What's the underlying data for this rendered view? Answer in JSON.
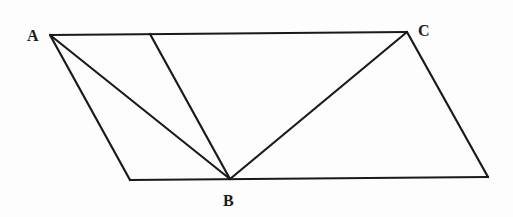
{
  "diagram": {
    "type": "geometry-parallelogram",
    "stroke_color": "#1a1a1a",
    "background": "#fdfdfd",
    "points": {
      "A": {
        "label": "A",
        "x": 50,
        "y": 35,
        "label_x": 27,
        "label_y": 41
      },
      "C": {
        "label": "C",
        "x": 407,
        "y": 32,
        "label_x": 418,
        "label_y": 36
      },
      "B": {
        "label": "B",
        "x": 230,
        "y": 179,
        "label_x": 223,
        "label_y": 206
      },
      "P": {
        "label": "",
        "x": 150,
        "y": 34
      },
      "D": {
        "label": "",
        "x": 130,
        "y": 180
      },
      "E": {
        "label": "",
        "x": 488,
        "y": 177
      }
    },
    "segments": [
      {
        "name": "top-edge-AC",
        "from": "A",
        "to": "C"
      },
      {
        "name": "left-edge-AD",
        "from": "A",
        "to": "D"
      },
      {
        "name": "bottom-edge-DE",
        "from": "D",
        "to": "E"
      },
      {
        "name": "right-edge-CE",
        "from": "C",
        "to": "E"
      },
      {
        "name": "diagonal-AB",
        "from": "A",
        "to": "B"
      },
      {
        "name": "segment-PB",
        "from": "P",
        "to": "B"
      },
      {
        "name": "diagonal-CB",
        "from": "C",
        "to": "B"
      }
    ]
  }
}
